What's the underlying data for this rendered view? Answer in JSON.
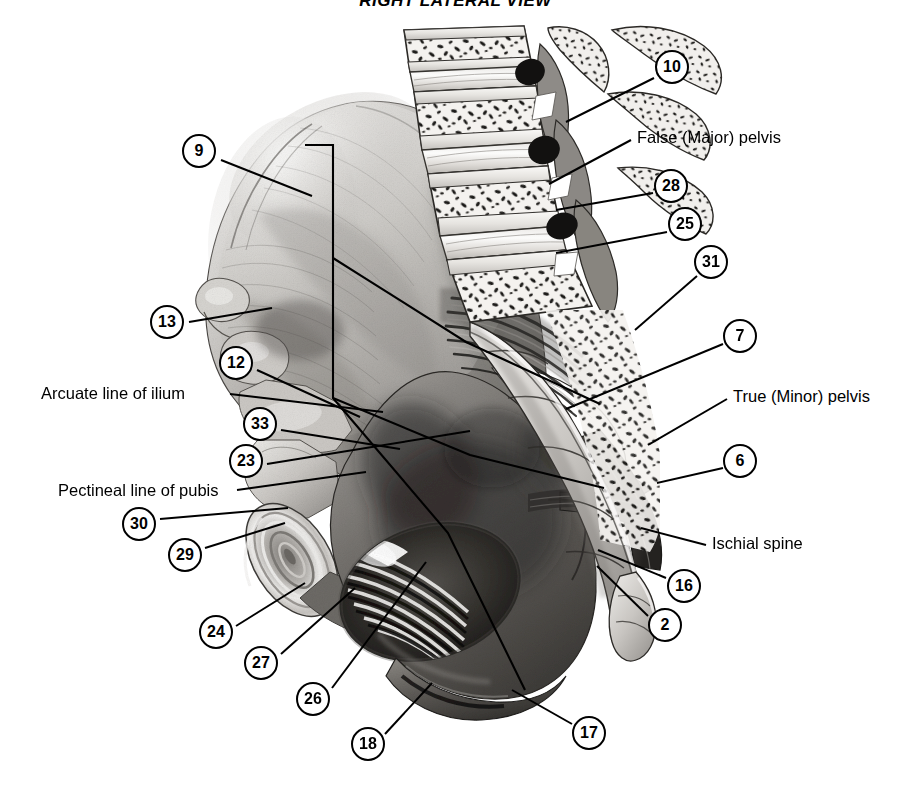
{
  "figure": {
    "title": "RIGHT LATERAL VIEW",
    "background_color": "#ffffff",
    "ink_color": "#000000",
    "rendering": "grayscale airbrush / pencil medical illustration"
  },
  "numbered_labels": [
    {
      "id": "9",
      "number": "9",
      "cx": 199,
      "cy": 151,
      "leader_to": [
        312,
        196
      ]
    },
    {
      "id": "10",
      "number": "10",
      "cx": 672,
      "cy": 67,
      "leader_to": [
        566,
        122
      ]
    },
    {
      "id": "13",
      "number": "13",
      "cx": 167,
      "cy": 322,
      "leader_to": [
        272,
        308
      ]
    },
    {
      "id": "12",
      "number": "12",
      "cx": 236,
      "cy": 363,
      "leader_to": [
        360,
        417
      ]
    },
    {
      "id": "28",
      "number": "28",
      "cx": 671,
      "cy": 186,
      "leader_to": [
        556,
        210
      ]
    },
    {
      "id": "25",
      "number": "25",
      "cx": 685,
      "cy": 224,
      "leader_to": [
        556,
        253
      ]
    },
    {
      "id": "31",
      "number": "31",
      "cx": 711,
      "cy": 262,
      "leader_to": [
        635,
        330
      ]
    },
    {
      "id": "7",
      "number": "7",
      "cx": 740,
      "cy": 336,
      "leader_to": [
        566,
        409
      ]
    },
    {
      "id": "33",
      "number": "33",
      "cx": 260,
      "cy": 424,
      "leader_to": [
        400,
        449
      ]
    },
    {
      "id": "23",
      "number": "23",
      "cx": 246,
      "cy": 461,
      "leader_to": [
        470,
        431
      ]
    },
    {
      "id": "6",
      "number": "6",
      "cx": 740,
      "cy": 461,
      "leader_to": [
        657,
        483
      ]
    },
    {
      "id": "30",
      "number": "30",
      "cx": 139,
      "cy": 524,
      "leader_to": [
        288,
        508
      ]
    },
    {
      "id": "29",
      "number": "29",
      "cx": 185,
      "cy": 555,
      "leader_to": [
        285,
        523
      ]
    },
    {
      "id": "16",
      "number": "16",
      "cx": 684,
      "cy": 586,
      "leader_to": [
        598,
        550
      ]
    },
    {
      "id": "24",
      "number": "24",
      "cx": 216,
      "cy": 632,
      "leader_to": [
        305,
        583
      ]
    },
    {
      "id": "2",
      "number": "2",
      "cx": 665,
      "cy": 625,
      "leader_to": [
        597,
        566
      ]
    },
    {
      "id": "27",
      "number": "27",
      "cx": 261,
      "cy": 663,
      "leader_to": [
        355,
        588
      ]
    },
    {
      "id": "26",
      "number": "26",
      "cx": 313,
      "cy": 699,
      "leader_to": [
        426,
        562
      ]
    },
    {
      "id": "18",
      "number": "18",
      "cx": 368,
      "cy": 744,
      "leader_to": [
        432,
        683
      ]
    },
    {
      "id": "17",
      "number": "17",
      "cx": 589,
      "cy": 733,
      "leader_to": [
        512,
        690
      ]
    }
  ],
  "text_labels": [
    {
      "id": "false-pelvis",
      "text": "False (Major) pelvis",
      "x": 637,
      "y": 128,
      "align": "left",
      "leader_from": [
        631,
        140
      ],
      "leader_to": [
        549,
        184
      ]
    },
    {
      "id": "arcuate-line",
      "text": "Arcuate line of ilium",
      "x": 41,
      "y": 384,
      "align": "left",
      "leader_from": [
        230,
        394
      ],
      "leader_to": [
        383,
        412
      ]
    },
    {
      "id": "pectineal-line",
      "text": "Pectineal line of pubis",
      "x": 58,
      "y": 481,
      "align": "left",
      "leader_from": [
        237,
        490
      ],
      "leader_to": [
        366,
        472
      ]
    },
    {
      "id": "true-pelvis",
      "text": "True (Minor) pelvis",
      "x": 733,
      "y": 387,
      "align": "left",
      "leader_from": [
        727,
        399
      ],
      "leader_to": [
        648,
        445
      ]
    },
    {
      "id": "ischial-spine",
      "text": "Ischial spine",
      "x": 712,
      "y": 534,
      "align": "left",
      "leader_from": [
        706,
        545
      ],
      "leader_to": [
        641,
        528
      ]
    }
  ],
  "pelvic_brim_line": {
    "description": "Black demarcation line dividing false pelvis from true pelvis",
    "points": [
      [
        305,
        145
      ],
      [
        333,
        145
      ],
      [
        333,
        398
      ],
      [
        448,
        533
      ],
      [
        525,
        690
      ]
    ]
  },
  "arcuate_guide_line": {
    "description": "Black line along arcuate line of ilium running from iliac crest to pubis",
    "points": [
      [
        333,
        258
      ],
      [
        466,
        342
      ],
      [
        600,
        404
      ]
    ]
  },
  "anatomy_regions": [
    {
      "id": "iliac-crest",
      "label": "Iliac crest"
    },
    {
      "id": "ilium-wing",
      "label": "Ala (wing) of ilium"
    },
    {
      "id": "lumbar-vertebrae",
      "label": "Lumbar vertebrae, sagittal section"
    },
    {
      "id": "sacrum",
      "label": "Sacrum"
    },
    {
      "id": "coccyx",
      "label": "Coccyx"
    },
    {
      "id": "greater-sciatic-notch",
      "label": "Greater sciatic notch"
    },
    {
      "id": "lesser-sciatic-notch",
      "label": "Lesser sciatic notch"
    },
    {
      "id": "sacrotuberous-ligament",
      "label": "Sacrotuberous ligament"
    },
    {
      "id": "sacrospinous-ligament",
      "label": "Sacrospinous ligament"
    },
    {
      "id": "obturator-foramen",
      "label": "Obturator foramen with obturator membrane"
    },
    {
      "id": "pubic-symphysis",
      "label": "Pubic symphysis"
    },
    {
      "id": "ischial-tuberosity",
      "label": "Ischial tuberosity"
    },
    {
      "id": "acetabulum",
      "label": "Acetabulum region"
    },
    {
      "id": "anterior-inferior-iliac-spine",
      "label": "Anterior inferior iliac spine"
    },
    {
      "id": "anterior-superior-iliac-spine",
      "label": "Anterior superior iliac spine"
    }
  ]
}
